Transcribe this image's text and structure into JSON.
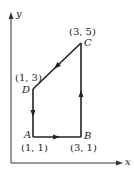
{
  "axes": {
    "x_label": "x",
    "y_label": "y"
  },
  "points": [
    {
      "name": "A",
      "coord": "(1, 1)"
    },
    {
      "name": "B",
      "coord": "(3, 1)"
    },
    {
      "name": "C",
      "coord": "(3, 5)"
    },
    {
      "name": "D",
      "coord": "(1, 3)"
    }
  ],
  "path": {
    "order": [
      "A",
      "B",
      "C",
      "D",
      "A"
    ],
    "color": "#222222"
  }
}
